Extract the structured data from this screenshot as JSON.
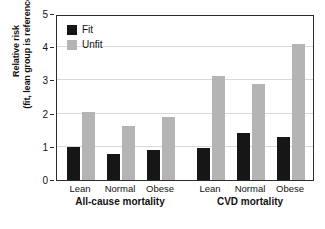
{
  "chart_data": {
    "type": "bar",
    "title": "",
    "xlabel": "",
    "ylabel": "Relative risk (fit, lean group is reference)",
    "ylabel_line1": "Relative risk",
    "ylabel_line2": "(fit, lean group is reference)",
    "ylim": [
      0,
      5
    ],
    "yticks": [
      0,
      1,
      2,
      3,
      4,
      5
    ],
    "ytick_labels": [
      "0",
      "1",
      "2",
      "3",
      "4",
      "5"
    ],
    "grid": true,
    "legend_position": "top-left",
    "categories": [
      "Lean",
      "Normal",
      "Obese",
      "Lean",
      "Normal",
      "Obese"
    ],
    "groups": [
      {
        "name": "All-cause mortality",
        "categories": [
          "Lean",
          "Normal",
          "Obese"
        ]
      },
      {
        "name": "CVD mortality",
        "categories": [
          "Lean",
          "Normal",
          "Obese"
        ]
      }
    ],
    "series": [
      {
        "name": "Fit",
        "color": "#161616",
        "values": [
          0.98,
          0.78,
          0.9,
          0.96,
          1.41,
          1.31
        ]
      },
      {
        "name": "Unfit",
        "color": "#b4b4b4",
        "values": [
          2.06,
          1.62,
          1.89,
          3.13,
          2.88,
          4.09
        ]
      }
    ]
  },
  "legend": {
    "items": [
      {
        "label": "Fit",
        "color": "#161616"
      },
      {
        "label": "Unfit",
        "color": "#b4b4b4"
      }
    ]
  },
  "axis": {
    "y_title_line1": "Relative risk",
    "y_title_line2": "(fit, lean group is reference)",
    "y_ticks": [
      "5",
      "4",
      "3",
      "2",
      "1",
      "0"
    ]
  },
  "colors": {
    "fit": "#161616",
    "unfit": "#b4b4b4",
    "grid": "#d9d9d9",
    "frame": "#2b2b2b",
    "text": "#111111",
    "background": "#ffffff"
  }
}
